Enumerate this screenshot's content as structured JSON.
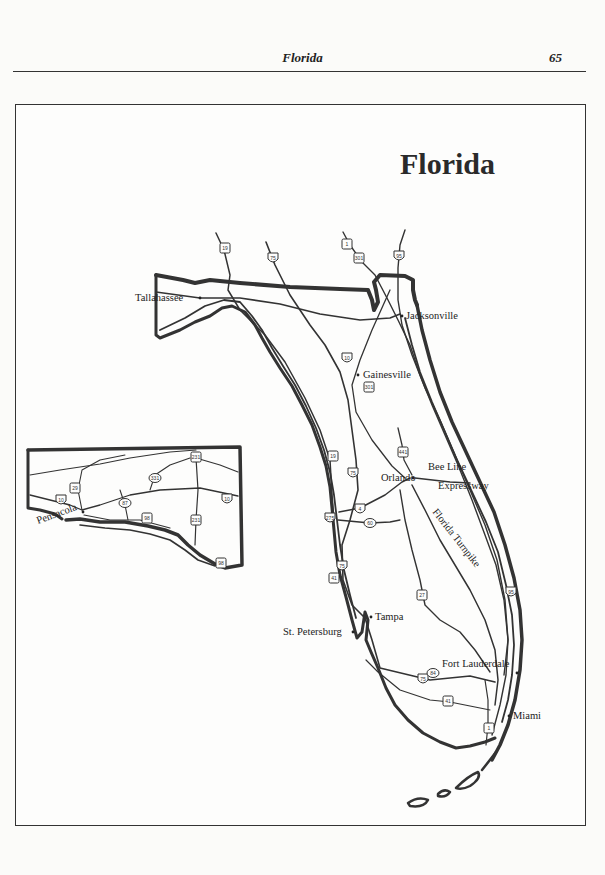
{
  "page": {
    "running_title": "Florida",
    "page_number": "65"
  },
  "map": {
    "title": "Florida",
    "cities": [
      {
        "name": "Tallahassee",
        "x": 200,
        "y": 298
      },
      {
        "name": "Jacksonville",
        "x": 402,
        "y": 316
      },
      {
        "name": "Gainesville",
        "x": 358,
        "y": 375
      },
      {
        "name": "Orlando",
        "x": 413,
        "y": 478
      },
      {
        "name": "Tampa",
        "x": 371,
        "y": 617
      },
      {
        "name": "St. Petersburg",
        "x": 353,
        "y": 632
      },
      {
        "name": "Fort Lauderdale",
        "x": 517,
        "y": 673
      },
      {
        "name": "Miami",
        "x": 509,
        "y": 716
      },
      {
        "name": "Pensacola",
        "x": 83,
        "y": 512
      }
    ],
    "road_labels": [
      {
        "name": "Bee Line",
        "x": 428,
        "y": 470
      },
      {
        "name": "Expressway",
        "x": 438,
        "y": 489
      },
      {
        "name": "Florida Turnpike",
        "x": 432,
        "y": 512,
        "rotate": 52
      }
    ],
    "shields": [
      {
        "route": "19",
        "x": 225,
        "y": 248,
        "type": "us"
      },
      {
        "route": "75",
        "x": 273,
        "y": 258,
        "type": "interstate"
      },
      {
        "route": "1",
        "x": 347,
        "y": 244,
        "type": "us"
      },
      {
        "route": "301",
        "x": 359,
        "y": 258,
        "type": "us"
      },
      {
        "route": "95",
        "x": 399,
        "y": 256,
        "type": "interstate"
      },
      {
        "route": "10",
        "x": 347,
        "y": 358,
        "type": "interstate"
      },
      {
        "route": "301",
        "x": 369,
        "y": 387,
        "type": "us"
      },
      {
        "route": "441",
        "x": 403,
        "y": 452,
        "type": "us"
      },
      {
        "route": "19",
        "x": 333,
        "y": 456,
        "type": "us"
      },
      {
        "route": "75",
        "x": 353,
        "y": 473,
        "type": "interstate"
      },
      {
        "route": "4",
        "x": 360,
        "y": 509,
        "type": "interstate"
      },
      {
        "route": "275",
        "x": 330,
        "y": 518,
        "type": "interstate"
      },
      {
        "route": "60",
        "x": 370,
        "y": 523,
        "type": "state"
      },
      {
        "route": "75",
        "x": 342,
        "y": 566,
        "type": "interstate"
      },
      {
        "route": "41",
        "x": 334,
        "y": 578,
        "type": "us"
      },
      {
        "route": "27",
        "x": 422,
        "y": 595,
        "type": "us"
      },
      {
        "route": "95",
        "x": 511,
        "y": 592,
        "type": "interstate"
      },
      {
        "route": "75",
        "x": 423,
        "y": 679,
        "type": "interstate"
      },
      {
        "route": "84",
        "x": 433,
        "y": 673,
        "type": "state"
      },
      {
        "route": "41",
        "x": 448,
        "y": 701,
        "type": "us"
      },
      {
        "route": "1",
        "x": 489,
        "y": 728,
        "type": "us"
      },
      {
        "route": "29",
        "x": 75,
        "y": 488,
        "type": "us"
      },
      {
        "route": "10",
        "x": 61,
        "y": 500,
        "type": "interstate"
      },
      {
        "route": "87",
        "x": 125,
        "y": 503,
        "type": "state"
      },
      {
        "route": "331",
        "x": 155,
        "y": 478,
        "type": "state"
      },
      {
        "route": "98",
        "x": 147,
        "y": 518,
        "type": "us"
      },
      {
        "route": "231",
        "x": 196,
        "y": 520,
        "type": "us"
      },
      {
        "route": "231",
        "x": 196,
        "y": 457,
        "type": "us"
      },
      {
        "route": "10",
        "x": 227,
        "y": 499,
        "type": "interstate"
      },
      {
        "route": "98",
        "x": 221,
        "y": 563,
        "type": "us"
      }
    ]
  }
}
